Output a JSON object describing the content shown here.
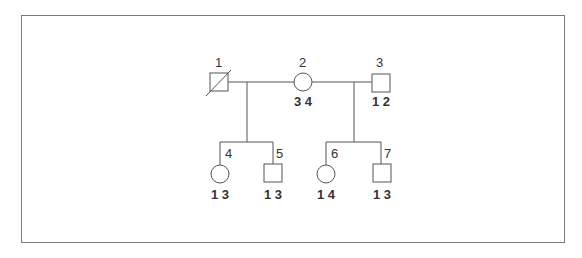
{
  "diagram": {
    "type": "pedigree",
    "colors": {
      "line": "#555555",
      "frame": "#7a7a7a",
      "text": "#333333"
    },
    "individuals": [
      {
        "id": "1",
        "label": "1",
        "sex": "male",
        "deceased": true,
        "genotype": ""
      },
      {
        "id": "2",
        "label": "2",
        "sex": "female",
        "deceased": false,
        "genotype": "3 4"
      },
      {
        "id": "3",
        "label": "3",
        "sex": "male",
        "deceased": false,
        "genotype": "1 2"
      },
      {
        "id": "4",
        "label": "4",
        "sex": "female",
        "deceased": false,
        "genotype": "1 3"
      },
      {
        "id": "5",
        "label": "5",
        "sex": "male",
        "deceased": false,
        "genotype": "1 3"
      },
      {
        "id": "6",
        "label": "6",
        "sex": "female",
        "deceased": false,
        "genotype": "1 4"
      },
      {
        "id": "7",
        "label": "7",
        "sex": "male",
        "deceased": false,
        "genotype": "1 3"
      }
    ],
    "matings": [
      {
        "partners": [
          "1",
          "2"
        ],
        "children": [
          "4",
          "5"
        ]
      },
      {
        "partners": [
          "2",
          "3"
        ],
        "children": [
          "6",
          "7"
        ]
      }
    ]
  }
}
